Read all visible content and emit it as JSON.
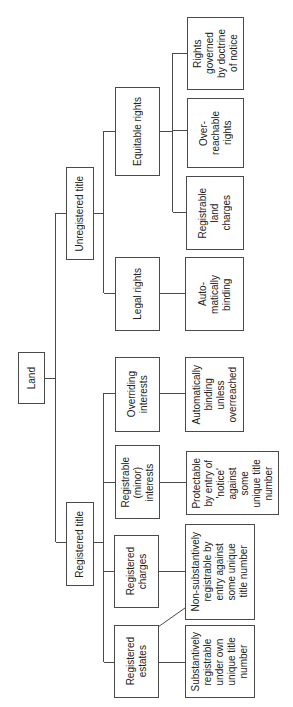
{
  "diagram": {
    "line_color": "#4a4a4a",
    "text_color": "#222222",
    "background": "#ffffff",
    "orientation": "rotated-90-ccw",
    "nodes": {
      "land": {
        "label": "Land",
        "parent": null
      },
      "unregistered": {
        "label": "Unregistered title",
        "parent": "land"
      },
      "registered": {
        "label": "Registered title",
        "parent": "land"
      },
      "equitable": {
        "label": "Equitable rights",
        "parent": "unregistered"
      },
      "legal": {
        "label": "Legal rights",
        "parent": "unregistered"
      },
      "overriding": {
        "label": "Overriding\ninterests",
        "parent": "registered"
      },
      "minor": {
        "label": "Registrable\n(minor)\ninterests",
        "parent": "registered"
      },
      "charges": {
        "label": "Registered\ncharges",
        "parent": "registered"
      },
      "estates": {
        "label": "Registered\nestates",
        "parent": "registered"
      },
      "doctrine": {
        "label": "Rights\ngoverned\nby doctrine\nof notice",
        "parent": "equitable"
      },
      "overreachable": {
        "label": "Over-\nreachable\nrights",
        "parent": "equitable"
      },
      "landcharges": {
        "label": "Registrable\nland\ncharges",
        "parent": "equitable"
      },
      "auto": {
        "label": "Auto-\nmatically\nbinding",
        "parent": "legal"
      },
      "overreached": {
        "label": "Automatically\nbinding\nunless\noverreached",
        "parent": "overriding"
      },
      "protectable": {
        "label": "Protectable\nby entry of\n'notice'\nagainst\nsome\nunique title\nnumber",
        "parent": "minor"
      },
      "nonsub": {
        "label": "Non-substantively\nregistrable by\nentry against\nsome unique\ntitle number",
        "parent": "charges",
        "also_linked_from": "estates"
      },
      "sub": {
        "label": "Substantively\nregistrable\nunder own\nunique title\nnumber",
        "parent": "estates"
      }
    }
  }
}
